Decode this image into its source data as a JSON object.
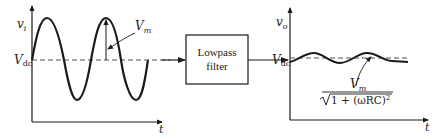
{
  "diagram": {
    "input_plot": {
      "y_label": "v",
      "y_label_sub": "i",
      "x_label": "t",
      "dc_label": "V",
      "dc_label_sub": "dc",
      "amplitude_label": "V",
      "amplitude_label_sub": "m"
    },
    "filter_block": {
      "line1": "Lowpass",
      "line2": "filter"
    },
    "output_plot": {
      "y_label": "v",
      "y_label_sub": "o",
      "x_label": "t",
      "dc_label": "V",
      "dc_label_sub": "dc",
      "amplitude_numerator": "V",
      "amplitude_numerator_sub": "m",
      "amplitude_denominator_prefix": "1 + (ωRC)",
      "amplitude_denominator_exp": "2"
    },
    "colors": {
      "stroke": "#1a1a1a",
      "dashed": "#555555"
    }
  }
}
